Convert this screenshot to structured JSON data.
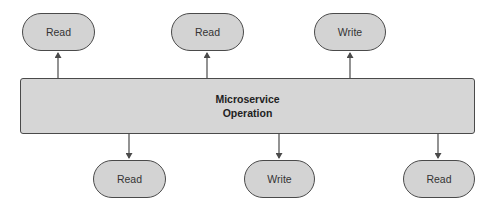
{
  "diagram": {
    "type": "flowchart",
    "colors": {
      "node_fill": "#d3d3d3",
      "node_stroke": "#4a4a4a",
      "box_fill": "#d6d6d6",
      "arrow": "#4a4a4a",
      "background": "#ffffff"
    },
    "center": {
      "line1": "Microservice",
      "line2": "Operation"
    },
    "top_nodes": [
      {
        "label": "Read"
      },
      {
        "label": "Read"
      },
      {
        "label": "Write"
      }
    ],
    "bottom_nodes": [
      {
        "label": "Read"
      },
      {
        "label": "Write"
      },
      {
        "label": "Read"
      }
    ],
    "edges": [
      {
        "from": "Microservice Operation",
        "to": "top_nodes.0",
        "direction": "up"
      },
      {
        "from": "Microservice Operation",
        "to": "top_nodes.1",
        "direction": "up"
      },
      {
        "from": "Microservice Operation",
        "to": "top_nodes.2",
        "direction": "up"
      },
      {
        "from": "Microservice Operation",
        "to": "bottom_nodes.0",
        "direction": "down"
      },
      {
        "from": "Microservice Operation",
        "to": "bottom_nodes.1",
        "direction": "down"
      },
      {
        "from": "Microservice Operation",
        "to": "bottom_nodes.2",
        "direction": "down"
      }
    ]
  }
}
